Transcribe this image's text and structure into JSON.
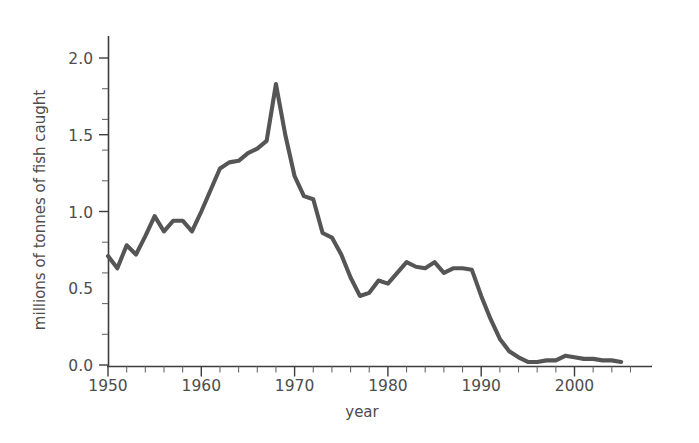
{
  "chart_data": {
    "type": "line",
    "title": "",
    "xlabel": "year",
    "ylabel": "millions of tonnes of fish caught",
    "xlim": [
      1950,
      2007
    ],
    "ylim": [
      0.0,
      2.15
    ],
    "grid": false,
    "legend": "none",
    "line_color": "#555555",
    "axis_color": "#3d3d3d",
    "text_color": "#4d4d4d",
    "background": "#ffffff",
    "x_tick_labels": [
      "1950",
      "1960",
      "1970",
      "1980",
      "1990",
      "2000"
    ],
    "x_major_ticks": [
      1950,
      1960,
      1970,
      1980,
      1990,
      2000
    ],
    "x_minor_tick_step": 2,
    "y_tick_labels": [
      "0.0",
      "0.5",
      "1.0",
      "1.5",
      "2.0"
    ],
    "y_major_ticks": [
      0.0,
      0.5,
      1.0,
      1.5,
      2.0
    ],
    "y_minor_tick_step": 0.1,
    "series": [
      {
        "name": "fish caught",
        "x": [
          1950,
          1951,
          1952,
          1953,
          1954,
          1955,
          1956,
          1957,
          1958,
          1959,
          1960,
          1961,
          1962,
          1963,
          1964,
          1965,
          1966,
          1967,
          1968,
          1969,
          1970,
          1971,
          1972,
          1973,
          1974,
          1975,
          1976,
          1977,
          1978,
          1979,
          1980,
          1981,
          1982,
          1983,
          1984,
          1985,
          1986,
          1987,
          1988,
          1989,
          1990,
          1991,
          1992,
          1993,
          1994,
          1995,
          1996,
          1997,
          1998,
          1999,
          2000,
          2001,
          2002,
          2003,
          2004,
          2005
        ],
        "values": [
          0.71,
          0.63,
          0.78,
          0.72,
          0.84,
          0.97,
          0.87,
          0.94,
          0.94,
          0.87,
          1.0,
          1.14,
          1.28,
          1.32,
          1.33,
          1.38,
          1.41,
          1.46,
          1.83,
          1.5,
          1.23,
          1.1,
          1.08,
          0.86,
          0.83,
          0.72,
          0.57,
          0.45,
          0.47,
          0.55,
          0.53,
          0.6,
          0.67,
          0.64,
          0.63,
          0.67,
          0.6,
          0.63,
          0.63,
          0.62,
          0.45,
          0.3,
          0.17,
          0.09,
          0.05,
          0.02,
          0.02,
          0.03,
          0.03,
          0.06,
          0.05,
          0.04,
          0.04,
          0.03,
          0.03,
          0.02
        ]
      }
    ],
    "annotations": {
      "peak_year": 1968,
      "peak_value": 1.83,
      "collapse_decade": "1990s",
      "min_value": 0.02
    }
  },
  "axes": {
    "y_axis_title": "millions of tonnes of fish caught",
    "x_axis_title": "year",
    "y_labels": [
      "2.0",
      "1.5",
      "1.0",
      "0.5",
      "0.0"
    ],
    "x_labels": [
      "1950",
      "1960",
      "1970",
      "1980",
      "1990",
      "2000"
    ]
  }
}
